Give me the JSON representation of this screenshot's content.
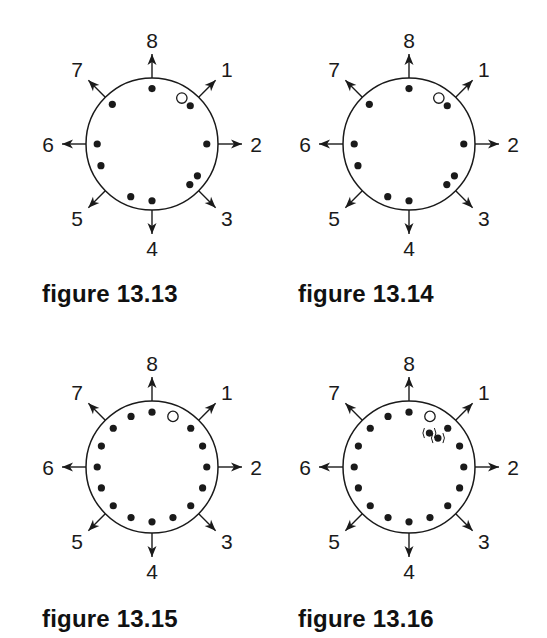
{
  "chart_data": [
    {
      "type": "scatter",
      "title": "figure 13.13",
      "direction_labels": [
        "8",
        "1",
        "2",
        "3",
        "4",
        "5",
        "6",
        "7"
      ],
      "direction_angles_deg": [
        0,
        45,
        90,
        135,
        180,
        225,
        270,
        315
      ],
      "filled_dots": [
        {
          "angle_deg": 0,
          "r": 0.84
        },
        {
          "angle_deg": 315,
          "r": 0.85
        },
        {
          "angle_deg": 45,
          "r": 0.82
        },
        {
          "angle_deg": 90,
          "r": 0.83
        },
        {
          "angle_deg": 270,
          "r": 0.83
        },
        {
          "angle_deg": 247,
          "r": 0.84
        },
        {
          "angle_deg": 125,
          "r": 0.84
        },
        {
          "angle_deg": 137,
          "r": 0.84
        },
        {
          "angle_deg": 202,
          "r": 0.86
        },
        {
          "angle_deg": 180,
          "r": 0.86
        }
      ],
      "open_dots": [
        {
          "angle_deg": 33,
          "r": 0.83
        }
      ],
      "parenthesized_dots": []
    },
    {
      "type": "scatter",
      "title": "figure 13.14",
      "direction_labels": [
        "8",
        "1",
        "2",
        "3",
        "4",
        "5",
        "6",
        "7"
      ],
      "direction_angles_deg": [
        0,
        45,
        90,
        135,
        180,
        225,
        270,
        315
      ],
      "filled_dots": [
        {
          "angle_deg": 0,
          "r": 0.84
        },
        {
          "angle_deg": 315,
          "r": 0.85
        },
        {
          "angle_deg": 45,
          "r": 0.82
        },
        {
          "angle_deg": 90,
          "r": 0.83
        },
        {
          "angle_deg": 270,
          "r": 0.83
        },
        {
          "angle_deg": 247,
          "r": 0.84
        },
        {
          "angle_deg": 125,
          "r": 0.84
        },
        {
          "angle_deg": 137,
          "r": 0.84
        },
        {
          "angle_deg": 202,
          "r": 0.86
        },
        {
          "angle_deg": 180,
          "r": 0.86
        }
      ],
      "open_dots": [
        {
          "angle_deg": 33,
          "r": 0.83
        }
      ],
      "parenthesized_dots": []
    },
    {
      "type": "scatter",
      "title": "figure 13.15",
      "direction_labels": [
        "8",
        "1",
        "2",
        "3",
        "4",
        "5",
        "6",
        "7"
      ],
      "direction_angles_deg": [
        0,
        45,
        90,
        135,
        180,
        225,
        270,
        315
      ],
      "filled_dots": [
        {
          "angle_deg": 0,
          "r": 0.83
        },
        {
          "angle_deg": 45,
          "r": 0.83
        },
        {
          "angle_deg": 67.5,
          "r": 0.83
        },
        {
          "angle_deg": 90,
          "r": 0.83
        },
        {
          "angle_deg": 112.5,
          "r": 0.83
        },
        {
          "angle_deg": 135,
          "r": 0.83
        },
        {
          "angle_deg": 157.5,
          "r": 0.83
        },
        {
          "angle_deg": 180,
          "r": 0.83
        },
        {
          "angle_deg": 202.5,
          "r": 0.83
        },
        {
          "angle_deg": 225,
          "r": 0.83
        },
        {
          "angle_deg": 247.5,
          "r": 0.83
        },
        {
          "angle_deg": 270,
          "r": 0.83
        },
        {
          "angle_deg": 292.5,
          "r": 0.83
        },
        {
          "angle_deg": 315,
          "r": 0.83
        },
        {
          "angle_deg": 337.5,
          "r": 0.83
        }
      ],
      "open_dots": [
        {
          "angle_deg": 22.5,
          "r": 0.83
        }
      ],
      "parenthesized_dots": []
    },
    {
      "type": "scatter",
      "title": "figure 13.16",
      "direction_labels": [
        "8",
        "1",
        "2",
        "3",
        "4",
        "5",
        "6",
        "7"
      ],
      "direction_angles_deg": [
        0,
        45,
        90,
        135,
        180,
        225,
        270,
        315
      ],
      "filled_dots": [
        {
          "angle_deg": 0,
          "r": 0.83
        },
        {
          "angle_deg": 45,
          "r": 0.83
        },
        {
          "angle_deg": 67.5,
          "r": 0.83
        },
        {
          "angle_deg": 90,
          "r": 0.83
        },
        {
          "angle_deg": 112.5,
          "r": 0.83
        },
        {
          "angle_deg": 135,
          "r": 0.83
        },
        {
          "angle_deg": 157.5,
          "r": 0.83
        },
        {
          "angle_deg": 180,
          "r": 0.83
        },
        {
          "angle_deg": 202.5,
          "r": 0.83
        },
        {
          "angle_deg": 225,
          "r": 0.83
        },
        {
          "angle_deg": 247.5,
          "r": 0.83
        },
        {
          "angle_deg": 270,
          "r": 0.83
        },
        {
          "angle_deg": 292.5,
          "r": 0.83
        },
        {
          "angle_deg": 315,
          "r": 0.83
        },
        {
          "angle_deg": 337.5,
          "r": 0.83
        }
      ],
      "open_dots": [
        {
          "angle_deg": 22.5,
          "r": 0.83
        }
      ],
      "parenthesized_dots": [
        {
          "angle_deg": 31,
          "r": 0.6
        },
        {
          "angle_deg": 45,
          "r": 0.62
        }
      ]
    }
  ],
  "captions": [
    "figure 13.13",
    "figure 13.14",
    "figure 13.15",
    "figure 13.16"
  ],
  "colors": {
    "ink": "#1a1a1a",
    "background": "#ffffff"
  }
}
